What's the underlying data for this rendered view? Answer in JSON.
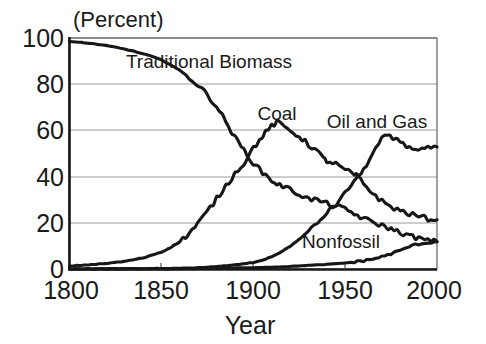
{
  "chart_data": {
    "type": "line",
    "title": "",
    "unit_label": "(Percent)",
    "xlabel": "Year",
    "ylabel": "",
    "xlim": [
      1800,
      2000
    ],
    "ylim": [
      0,
      100
    ],
    "xticks": [
      1800,
      1850,
      1900,
      1950,
      2000
    ],
    "yticks": [
      0,
      20,
      40,
      60,
      80,
      100
    ],
    "grid": true,
    "legend_position": "inline-annotations",
    "annotations": [
      {
        "text": "Traditional Biomass",
        "x": 1876,
        "y": 86
      },
      {
        "text": "Coal",
        "x": 1913,
        "y": 70
      },
      {
        "text": "Oil and Gas",
        "x": 1967,
        "y": 66
      },
      {
        "text": "Nonfossil",
        "x": 1942,
        "y": 10
      }
    ],
    "series": [
      {
        "name": "Traditional Biomass",
        "x": [
          1800,
          1805,
          1810,
          1815,
          1820,
          1825,
          1830,
          1835,
          1840,
          1845,
          1850,
          1855,
          1860,
          1865,
          1870,
          1875,
          1880,
          1885,
          1890,
          1895,
          1900,
          1905,
          1910,
          1913,
          1916,
          1920,
          1925,
          1930,
          1935,
          1940,
          1945,
          1950,
          1955,
          1960,
          1965,
          1970,
          1975,
          1980,
          1985,
          1990,
          1995,
          2000
        ],
        "values": [
          98.5,
          98.2,
          97.8,
          97.3,
          96.7,
          96.0,
          95.2,
          94.3,
          93.2,
          92.0,
          90.5,
          88.5,
          86.0,
          83.0,
          79.5,
          75.5,
          70.5,
          64.0,
          57.0,
          51.5,
          46.0,
          42.0,
          38.5,
          37.0,
          36.0,
          34.5,
          32.5,
          30.5,
          30.0,
          28.5,
          27.5,
          26.0,
          24.0,
          22.0,
          20.5,
          19.0,
          17.5,
          16.0,
          14.5,
          13.5,
          12.5,
          12.0
        ]
      },
      {
        "name": "Coal",
        "x": [
          1800,
          1810,
          1820,
          1830,
          1840,
          1850,
          1855,
          1860,
          1865,
          1870,
          1875,
          1880,
          1885,
          1890,
          1895,
          1900,
          1905,
          1910,
          1913,
          1917,
          1920,
          1925,
          1930,
          1935,
          1938,
          1940,
          1945,
          1950,
          1955,
          1957,
          1960,
          1965,
          1970,
          1975,
          1980,
          1985,
          1990,
          1995,
          2000
        ],
        "values": [
          1.5,
          2.0,
          2.6,
          3.5,
          5.0,
          7.5,
          9.5,
          12.0,
          15.5,
          20.0,
          25.0,
          30.5,
          36.0,
          41.5,
          46.0,
          52.5,
          57.5,
          62.0,
          63.5,
          61.5,
          60.0,
          57.5,
          54.0,
          51.0,
          48.0,
          47.0,
          45.5,
          43.0,
          41.0,
          40.0,
          37.0,
          33.0,
          29.5,
          27.0,
          25.5,
          24.0,
          23.0,
          22.0,
          21.5
        ]
      },
      {
        "name": "Oil and Gas",
        "x": [
          1800,
          1850,
          1860,
          1870,
          1880,
          1890,
          1900,
          1905,
          1910,
          1915,
          1920,
          1925,
          1930,
          1935,
          1940,
          1945,
          1950,
          1955,
          1957,
          1960,
          1965,
          1970,
          1973,
          1976,
          1980,
          1985,
          1990,
          1995,
          2000
        ],
        "values": [
          0.3,
          0.4,
          0.5,
          0.8,
          1.2,
          2.0,
          3.0,
          4.0,
          5.5,
          7.5,
          10.0,
          13.0,
          16.5,
          20.0,
          24.5,
          28.0,
          33.0,
          38.5,
          40.0,
          43.0,
          50.0,
          56.5,
          58.0,
          56.5,
          55.5,
          52.5,
          52.0,
          52.5,
          53.0
        ]
      },
      {
        "name": "Nonfossil",
        "x": [
          1800,
          1850,
          1880,
          1900,
          1910,
          1920,
          1930,
          1940,
          1950,
          1955,
          1960,
          1965,
          1970,
          1975,
          1980,
          1985,
          1990,
          1995,
          2000
        ],
        "values": [
          0.2,
          0.3,
          0.5,
          0.8,
          1.0,
          1.3,
          1.8,
          2.2,
          2.8,
          3.2,
          3.8,
          4.5,
          5.5,
          6.8,
          8.2,
          10.0,
          11.0,
          11.5,
          12.0
        ]
      }
    ]
  }
}
